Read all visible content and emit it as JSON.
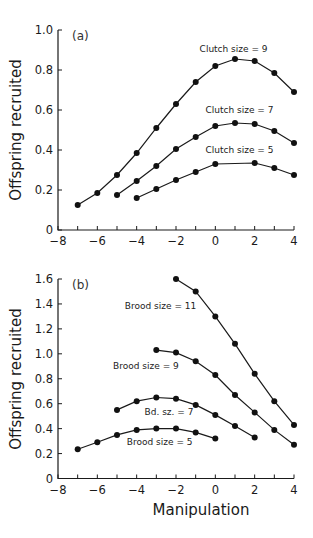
{
  "chart_data": [
    {
      "panel": "(a)",
      "type": "line",
      "title": "",
      "xlabel": "",
      "ylabel": "Offspring recruited",
      "xlim": [
        -8,
        4
      ],
      "ylim": [
        0,
        1.0
      ],
      "xticks": [
        -8,
        -6,
        -4,
        -2,
        0,
        2,
        4
      ],
      "xminor": [
        -7,
        -5,
        -3,
        -1,
        1,
        3
      ],
      "yticks": [
        0,
        0.2,
        0.4,
        0.6,
        0.8,
        1.0
      ],
      "ytick_labels": [
        "0",
        "0.2",
        "0.4",
        "0.6",
        "0.8",
        "1.0"
      ],
      "grid": false,
      "legend": "inline annotations",
      "series": [
        {
          "name": "Clutch size = 9",
          "x": [
            -7,
            -6,
            -5,
            -4,
            -3,
            -2,
            -1,
            0,
            1,
            2,
            3,
            4
          ],
          "values": [
            0.125,
            0.185,
            0.275,
            0.385,
            0.51,
            0.63,
            0.74,
            0.82,
            0.855,
            0.845,
            0.785,
            0.69
          ],
          "label_pos": [
            -0.8,
            0.89
          ]
        },
        {
          "name": "Clutch size = 7",
          "x": [
            -5,
            -4,
            -3,
            -2,
            -1,
            0,
            1,
            2,
            3,
            4
          ],
          "values": [
            0.175,
            0.245,
            0.32,
            0.405,
            0.465,
            0.52,
            0.535,
            0.53,
            0.495,
            0.435
          ],
          "label_pos": [
            -0.5,
            0.585
          ]
        },
        {
          "name": "Clutch size = 5",
          "x": [
            -4,
            -3,
            -2,
            -1,
            0,
            2,
            3,
            4
          ],
          "values": [
            0.16,
            0.205,
            0.25,
            0.29,
            0.33,
            0.335,
            0.31,
            0.275
          ],
          "label_pos": [
            -0.5,
            0.385
          ]
        }
      ]
    },
    {
      "panel": "(b)",
      "type": "line",
      "title": "",
      "xlabel": "Manipulation",
      "ylabel": "Offspring recruited",
      "xlim": [
        -8,
        4
      ],
      "ylim": [
        0,
        1.6
      ],
      "xticks": [
        -8,
        -6,
        -4,
        -2,
        0,
        2,
        4
      ],
      "xminor": [
        -7,
        -5,
        -3,
        -1,
        1,
        3
      ],
      "yticks": [
        0,
        0.2,
        0.4,
        0.6,
        0.8,
        1.0,
        1.2,
        1.4,
        1.6
      ],
      "ytick_labels": [
        "0",
        "0.2",
        "0.4",
        "0.6",
        "0.8",
        "1.0",
        "1.2",
        "1.4",
        "1.6"
      ],
      "grid": false,
      "legend": "inline annotations",
      "series": [
        {
          "name": "Brood size = 11",
          "x": [
            -2,
            -1,
            0,
            1,
            2,
            3,
            4
          ],
          "values": [
            1.6,
            1.5,
            1.3,
            1.08,
            0.84,
            0.62,
            0.43
          ],
          "label_pos": [
            -4.6,
            1.36
          ]
        },
        {
          "name": "Brood size = 9",
          "x": [
            -3,
            -2,
            -1,
            0,
            1,
            2,
            3,
            4
          ],
          "values": [
            1.03,
            1.01,
            0.94,
            0.83,
            0.67,
            0.53,
            0.39,
            0.27
          ],
          "label_pos": [
            -5.2,
            0.88
          ]
        },
        {
          "name": "Bd. sz. = 7",
          "x": [
            -5,
            -4,
            -3,
            -2,
            -1,
            0,
            1,
            2
          ],
          "values": [
            0.55,
            0.62,
            0.65,
            0.64,
            0.59,
            0.51,
            0.42,
            0.33
          ],
          "label_pos": [
            -3.6,
            0.51
          ]
        },
        {
          "name": "Brood size = 5",
          "x": [
            -7,
            -6,
            -5,
            -4,
            -3,
            -2,
            -1,
            0
          ],
          "values": [
            0.235,
            0.29,
            0.35,
            0.39,
            0.4,
            0.4,
            0.37,
            0.32
          ],
          "label_pos": [
            -4.5,
            0.27
          ]
        }
      ]
    }
  ],
  "figure": {
    "panel_a_label": "(a)",
    "panel_b_label": "(b)",
    "ylabel_a": "Offspring recruited",
    "ylabel_b": "Offspring recruited",
    "xlabel": "Manipulation"
  }
}
